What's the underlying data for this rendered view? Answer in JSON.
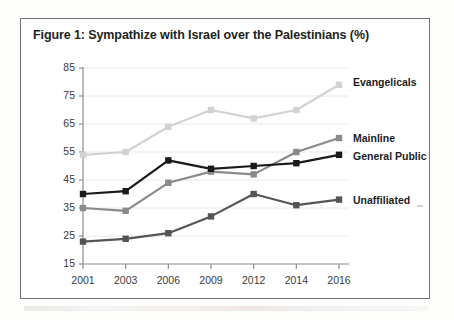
{
  "figure": {
    "title": "Figure 1: Sympathize with Israel over the Palestinians (%)"
  },
  "chart_data": {
    "type": "line",
    "title": "Figure 1: Sympathize with Israel over the Palestinians (%)",
    "xlabel": "",
    "ylabel": "",
    "categories": [
      "2001",
      "2003",
      "2006",
      "2009",
      "2012",
      "2014",
      "2016"
    ],
    "x": [
      2001,
      2003,
      2006,
      2009,
      2012,
      2014,
      2016
    ],
    "ylim": [
      15,
      85
    ],
    "yticks": [
      15,
      25,
      35,
      45,
      55,
      65,
      75,
      85
    ],
    "grid": "horizontal",
    "legend_position": "right-inline-labels",
    "markers": "square",
    "series": [
      {
        "name": "Evangelicals",
        "color": "#d2d2d2",
        "values": [
          54,
          55,
          64,
          70,
          67,
          70,
          79
        ],
        "label": "Evangelicals"
      },
      {
        "name": "Mainline",
        "color": "#8a8a8a",
        "values": [
          35,
          34,
          44,
          48,
          47,
          55,
          60
        ],
        "label": "Mainline"
      },
      {
        "name": "General Public",
        "color": "#1a1a1a",
        "values": [
          40,
          41,
          52,
          49,
          50,
          51,
          54
        ],
        "label": "General Public"
      },
      {
        "name": "Unaffiliated",
        "color": "#555555",
        "values": [
          23,
          24,
          26,
          32,
          40,
          36,
          38
        ],
        "label": "Unaffiliated"
      }
    ]
  },
  "axes": {
    "y_tick_labels": [
      "85",
      "75",
      "65",
      "55",
      "45",
      "35",
      "25",
      "15"
    ],
    "x_tick_labels": [
      "2001",
      "2003",
      "2006",
      "2009",
      "2012",
      "2014",
      "2016"
    ]
  },
  "series_labels": {
    "evangelicals": "Evangelicals",
    "mainline": "Mainline",
    "general_public": "General Public",
    "unaffiliated": "Unaffiliated"
  },
  "colors": {
    "evangelicals": "#d2d2d2",
    "mainline": "#8a8a8a",
    "general_public": "#1a1a1a",
    "unaffiliated": "#555555",
    "frame": "#6f7276",
    "gridline": "#e8e8e8",
    "axis": "#8c8c8c",
    "text": "#231f20"
  }
}
